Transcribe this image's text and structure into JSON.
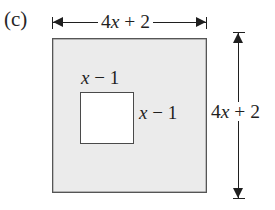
{
  "figure": {
    "part_label": "(c)",
    "background_color": "#ffffff",
    "outer_square": {
      "fill_color": "#ebebeb",
      "border_color": "#555555",
      "top_dimension_label": "4x + 2",
      "right_dimension_label": "4x + 2"
    },
    "inner_square": {
      "fill_color": "#ffffff",
      "border_color": "#4a4a4a",
      "top_label": "x − 1",
      "right_label": "x − 1"
    },
    "expressions": {
      "side_coefficient": "4",
      "side_variable": "x",
      "side_constant": "+ 2",
      "hole_variable": "x",
      "hole_constant": "− 1"
    }
  }
}
